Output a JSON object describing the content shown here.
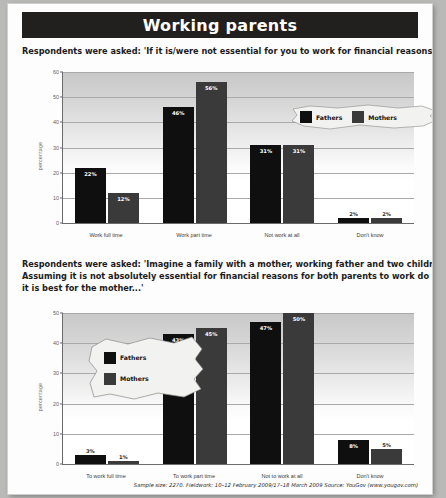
{
  "page": {
    "title": "Working parents",
    "footer": "Sample size: 2270. Fieldwork: 10–12 February 2009/17–18 March 2009 Source: YouGov (www.yougov.com)"
  },
  "questions": {
    "q1": {
      "lines": [
        "Respondents were asked: 'If it is/were not essential for you to work for financial reasons would you...'"
      ]
    },
    "q2": {
      "lines": [
        "Respondents were asked: 'Imagine a family with a mother, working father and two children under five.",
        "Assuming it is not absolutely essential for financial reasons for both parents to work do you think",
        "it is best for the mother...'"
      ]
    }
  },
  "legend": {
    "fathers": "Fathers",
    "mothers": "Mothers",
    "fathers_color": "#100f0f",
    "mothers_color": "#3a3a3a"
  },
  "chart_data": [
    {
      "id": "chart-1",
      "type": "bar",
      "title": "",
      "xlabel": "",
      "ylabel": "percentage",
      "ylim": [
        0,
        60
      ],
      "yticks": [
        0,
        10,
        20,
        30,
        40,
        50,
        60
      ],
      "grid": true,
      "legend_position": "top-right",
      "categories": [
        "Work full time",
        "Work part time",
        "Not work at all",
        "Don't know"
      ],
      "series": [
        {
          "name": "Fathers",
          "values": [
            22,
            46,
            31,
            2
          ],
          "labels": [
            "22%",
            "46%",
            "31%",
            "2%"
          ]
        },
        {
          "name": "Mothers",
          "values": [
            12,
            56,
            31,
            2
          ],
          "labels": [
            "12%",
            "56%",
            "31%",
            "2%"
          ]
        }
      ]
    },
    {
      "id": "chart-2",
      "type": "bar",
      "title": "",
      "xlabel": "",
      "ylabel": "percentage",
      "ylim": [
        0,
        50
      ],
      "yticks": [
        0,
        10,
        20,
        30,
        40,
        50
      ],
      "grid": true,
      "legend_position": "inside-top-left",
      "categories": [
        "To work full time",
        "To work part time",
        "Not to work at all",
        "Don't know"
      ],
      "series": [
        {
          "name": "Fathers",
          "values": [
            3,
            43,
            47,
            8
          ],
          "labels": [
            "3%",
            "43%",
            "47%",
            "8%"
          ]
        },
        {
          "name": "Mothers",
          "values": [
            1,
            45,
            50,
            5
          ],
          "labels": [
            "1%",
            "45%",
            "50%",
            "5%"
          ]
        }
      ]
    }
  ]
}
